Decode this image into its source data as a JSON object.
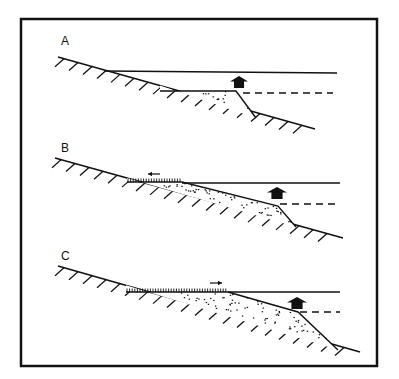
{
  "figure": {
    "frame": {
      "x": 21,
      "y": 19,
      "w": 356,
      "h": 347
    },
    "colors": {
      "ink": "#111111",
      "background": "#ffffff"
    },
    "panels": [
      {
        "label": "A",
        "label_pos": [
          61,
          35
        ],
        "ground": [
          [
            58,
            57
          ],
          [
            315,
            129
          ]
        ],
        "water_line": [
          [
            105,
            71
          ],
          [
            337,
            73
          ]
        ],
        "deposit": [
          [
            160,
            91
          ],
          [
            236,
            91
          ],
          [
            256,
            118
          ]
        ],
        "dashed_line": [
          [
            243,
            93
          ],
          [
            333,
            93
          ]
        ],
        "house_arrow": {
          "x": 230,
          "y": 76,
          "w": 18,
          "h": 12
        },
        "vegetation": null,
        "shift_arrow": null
      },
      {
        "label": "B",
        "label_pos": [
          61,
          142
        ],
        "ground": [
          [
            55,
            158
          ],
          [
            343,
            238
          ]
        ],
        "water_line": [
          [
            182,
            183
          ],
          [
            340,
            183
          ]
        ],
        "deposit": [
          [
            127,
            182
          ],
          [
            182,
            182
          ],
          [
            278,
            206
          ],
          [
            296,
            227
          ]
        ],
        "dashed_line": [
          [
            280,
            204
          ],
          [
            340,
            204
          ]
        ],
        "house_arrow": {
          "x": 267,
          "y": 187,
          "w": 20,
          "h": 12
        },
        "vegetation": [
          127,
          182,
          182
        ],
        "shift_arrow": {
          "dir": "left",
          "x1": 160,
          "x2": 148,
          "y": 174
        }
      },
      {
        "label": "C",
        "label_pos": [
          61,
          250
        ],
        "ground": [
          [
            58,
            266
          ],
          [
            360,
            352
          ]
        ],
        "water_line": [
          [
            228,
            292
          ],
          [
            340,
            292
          ]
        ],
        "deposit": [
          [
            126,
            292
          ],
          [
            228,
            292
          ],
          [
            298,
            312
          ],
          [
            338,
            350
          ]
        ],
        "dashed_line": [
          [
            300,
            312
          ],
          [
            340,
            312
          ]
        ],
        "house_arrow": {
          "x": 287,
          "y": 297,
          "w": 20,
          "h": 12
        },
        "vegetation": [
          126,
          228,
          292
        ],
        "shift_arrow": {
          "dir": "right",
          "x1": 210,
          "x2": 222,
          "y": 283
        }
      }
    ]
  }
}
